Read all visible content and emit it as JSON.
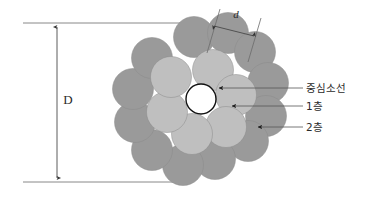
{
  "figure": {
    "background_color": "#ffffff"
  },
  "dimensions": {
    "outer_diameter": {
      "label": "D",
      "orientation": "vertical",
      "description": "overall rope diameter dimension on the left side"
    },
    "strand_diameter": {
      "label": "d",
      "orientation": "diagonal",
      "description": "single wire diameter dimension at the top right"
    }
  },
  "annotations": [
    {
      "id": "center-strand",
      "label": "중심소선"
    },
    {
      "id": "layer-1",
      "label": "1층"
    },
    {
      "id": "layer-2",
      "label": "2층"
    }
  ],
  "colors": {
    "center_strand_fill": "#ffffff",
    "center_strand_stroke": "#111111",
    "layer1_fill": "#bfbfbf",
    "layer2_fill": "#9a9a9a",
    "wire_outline": "#8a8a8a",
    "line_color": "#5a5a5a",
    "text_color": "#222222"
  },
  "geometry": {
    "center": {
      "cx": 201,
      "cy": 99
    },
    "center_radius": 15,
    "wire_radius": 20.5,
    "layer1_ring_radius": 31,
    "layer2_ring_radius": 60,
    "layer1_count": 6,
    "layer2_count": 12
  },
  "layer1_wires": [
    {
      "cx": 213,
      "cy": 70
    },
    {
      "cx": 236,
      "cy": 95
    },
    {
      "cx": 226,
      "cy": 127
    },
    {
      "cx": 192,
      "cy": 134
    },
    {
      "cx": 167,
      "cy": 112
    },
    {
      "cx": 171,
      "cy": 77
    }
  ],
  "layer2_wires": [
    {
      "cx": 194,
      "cy": 37
    },
    {
      "cx": 228,
      "cy": 33
    },
    {
      "cx": 255,
      "cy": 52
    },
    {
      "cx": 268,
      "cy": 83
    },
    {
      "cx": 266,
      "cy": 116
    },
    {
      "cx": 248,
      "cy": 141
    },
    {
      "cx": 215,
      "cy": 159
    },
    {
      "cx": 183,
      "cy": 165
    },
    {
      "cx": 152,
      "cy": 150
    },
    {
      "cx": 135,
      "cy": 122
    },
    {
      "cx": 133,
      "cy": 89
    },
    {
      "cx": 152,
      "cy": 58
    }
  ],
  "guide_lines": {
    "top_y": 23,
    "bottom_y": 182,
    "left_x": 23,
    "right_x": 190
  },
  "dimension_arrow": {
    "x": 57,
    "top_y": 26,
    "bottom_y": 179
  }
}
